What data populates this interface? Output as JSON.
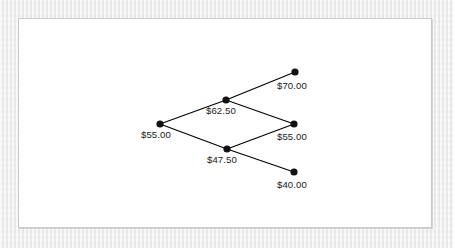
{
  "figure": {
    "panel": {
      "background_color": "#ffffff",
      "border_color": "#c9c9c9"
    },
    "page_background_color": "#eeeeee",
    "line_color": "#000000",
    "node_color": "#111111",
    "text_color": "#1a1a1a"
  },
  "chart_data": {
    "type": "diagram",
    "title": "",
    "xlabel": "",
    "ylabel": "",
    "grid": false,
    "legend": null,
    "diagram_kind": "binomial-tree",
    "steps": 2,
    "nodes": [
      {
        "id": "n0",
        "step": 0,
        "state": 0,
        "label": "$55.00",
        "value": 55.0,
        "x": 160,
        "y": 124,
        "label_x": 141,
        "label_y": 138,
        "label_anchor": "start"
      },
      {
        "id": "n1u",
        "step": 1,
        "state": 1,
        "label": "$62.50",
        "value": 62.5,
        "x": 226,
        "y": 100,
        "label_x": 206,
        "label_y": 114,
        "label_anchor": "start"
      },
      {
        "id": "n1d",
        "step": 1,
        "state": 0,
        "label": "$47.50",
        "value": 47.5,
        "x": 227,
        "y": 149,
        "label_x": 207,
        "label_y": 163,
        "label_anchor": "start"
      },
      {
        "id": "n2uu",
        "step": 2,
        "state": 2,
        "label": "$70.00",
        "value": 70.0,
        "x": 295,
        "y": 72,
        "label_x": 277,
        "label_y": 89,
        "label_anchor": "start"
      },
      {
        "id": "n2ud",
        "step": 2,
        "state": 1,
        "label": "$55.00",
        "value": 55.0,
        "x": 294,
        "y": 124,
        "label_x": 277,
        "label_y": 140,
        "label_anchor": "start"
      },
      {
        "id": "n2dd",
        "step": 2,
        "state": 0,
        "label": "$40.00",
        "value": 40.0,
        "x": 294,
        "y": 172,
        "label_x": 277,
        "label_y": 188,
        "label_anchor": "start"
      }
    ],
    "edges": [
      {
        "id": "e-up-0",
        "from": "n0",
        "to": "n1u",
        "direction": "up",
        "x1": 160,
        "y1": 124,
        "x2": 226,
        "y2": 100
      },
      {
        "id": "e-down-0",
        "from": "n0",
        "to": "n1d",
        "direction": "down",
        "x1": 160,
        "y1": 124,
        "x2": 227,
        "y2": 149
      },
      {
        "id": "e-up-1u",
        "from": "n1u",
        "to": "n2uu",
        "direction": "up",
        "x1": 226,
        "y1": 100,
        "x2": 295,
        "y2": 72
      },
      {
        "id": "e-down-1u",
        "from": "n1u",
        "to": "n2ud",
        "direction": "down",
        "x1": 226,
        "y1": 100,
        "x2": 294,
        "y2": 124
      },
      {
        "id": "e-up-1d",
        "from": "n1d",
        "to": "n2ud",
        "direction": "up",
        "x1": 227,
        "y1": 149,
        "x2": 294,
        "y2": 124
      },
      {
        "id": "e-down-1d",
        "from": "n1d",
        "to": "n2dd",
        "direction": "down",
        "x1": 227,
        "y1": 149,
        "x2": 294,
        "y2": 172
      }
    ],
    "node_radius": 3.6,
    "values": [
      55.0,
      62.5,
      47.5,
      70.0,
      55.0,
      40.0
    ],
    "categories": [
      "$55.00",
      "$62.50",
      "$47.50",
      "$70.00",
      "$55.00",
      "$40.00"
    ]
  }
}
